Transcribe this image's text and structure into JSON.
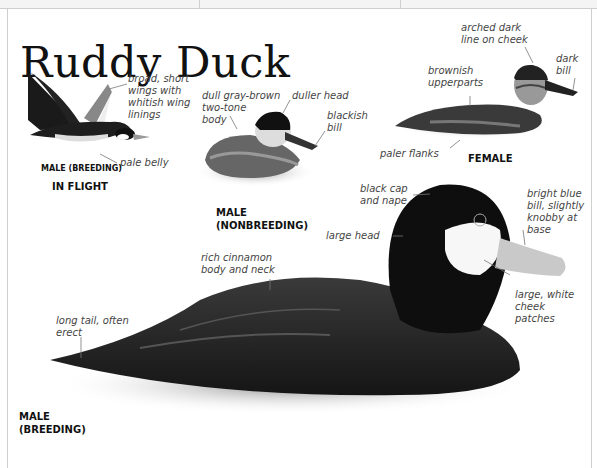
{
  "page": {
    "title": "Ruddy Duck"
  },
  "figures": {
    "in_flight": {
      "caption_sex": "MALE (BREEDING)",
      "caption_view": "IN FLIGHT",
      "labels": {
        "wings": "broad, short\nwings with\nwhitish wing\nlinings",
        "belly": "pale belly"
      }
    },
    "male_nonbreeding": {
      "caption": "MALE\n(NONBREEDING)",
      "labels": {
        "body": "dull gray-brown\ntwo-tone\nbody",
        "head": "duller head",
        "bill": "blackish\nbill"
      }
    },
    "female": {
      "caption": "FEMALE",
      "labels": {
        "cheek": "arched dark\nline on cheek",
        "bill": "dark\nbill",
        "upperparts": "brownish\nupperparts",
        "flanks": "paler flanks"
      }
    },
    "male_breeding": {
      "caption": "MALE\n(BREEDING)",
      "labels": {
        "cap": "black cap\nand nape",
        "bill": "bright blue\nbill, slightly\nknobby at\nbase",
        "head": "large head",
        "body": "rich cinnamon\nbody and neck",
        "cheek": "large, white\ncheek\npatches",
        "tail": "long tail, often\nerect"
      }
    }
  },
  "colors": {
    "text": "#111111",
    "label": "#444444",
    "frame": "#cfcfcf"
  }
}
